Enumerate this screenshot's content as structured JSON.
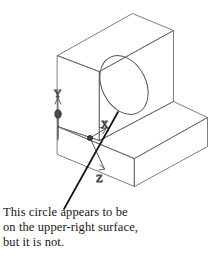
{
  "figure": {
    "name": "isometric-solid-with-circle",
    "background_color": "#ffffff",
    "line_color": "#6e6e6e",
    "line_color_dark": "#4a4a4a",
    "leader_color": "#111111",
    "text_color": "#171717"
  },
  "axes_indicator": {
    "name": "ucs-icon",
    "x_label": "X",
    "y_label": "Y",
    "z_label": "Z",
    "origin": {
      "x": 90,
      "y": 138
    }
  },
  "annotation": {
    "leader": {
      "from_x": 64,
      "from_y": 209,
      "to_x": 118,
      "to_y": 112
    },
    "lines": [
      "This circle appears to be",
      "on the upper-right surface,",
      "but it is not."
    ]
  },
  "geometry": {
    "back_plate_label": "vertical-back-plate",
    "base_block_label": "horizontal-base-block",
    "circle_label": "circle-on-front-face"
  }
}
